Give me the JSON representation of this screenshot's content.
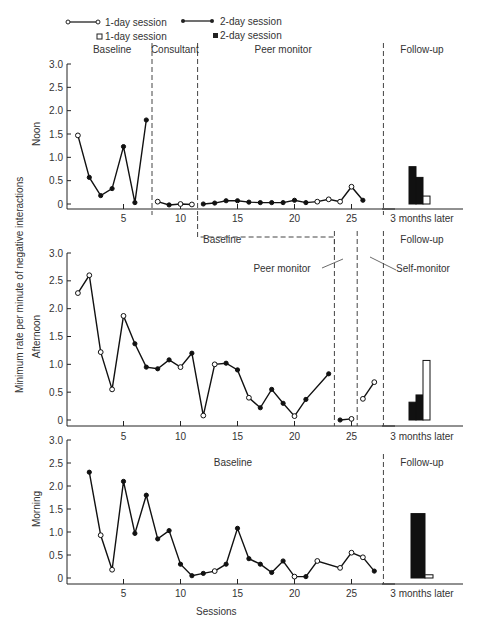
{
  "chart_data": {
    "type": "line",
    "ylabel": "Minimum rate per minute of negative interactions",
    "xlabel": "Sessions",
    "followup_xlabel": "3 months later",
    "legend": {
      "placement": "top",
      "items": [
        {
          "label": "1-day session",
          "marker": "open-circle-line"
        },
        {
          "label": "2-day session",
          "marker": "filled-circle-line"
        },
        {
          "label": "1-day session",
          "marker": "open-square"
        },
        {
          "label": "2-day session",
          "marker": "filled-square"
        }
      ]
    },
    "x_ticks": [
      5,
      10,
      15,
      20,
      25
    ],
    "xlim": [
      0,
      28
    ],
    "ylim": [
      0,
      3.0
    ],
    "y_ticks": [
      "0",
      "0.5",
      "1.0",
      "1.5",
      "2.0",
      "2.5",
      "3.0"
    ],
    "panels": [
      {
        "name": "Noon",
        "phases": [
          {
            "label": "Baseline",
            "start": 1,
            "end": 7
          },
          {
            "label": "Consultant",
            "start": 8,
            "end": 11
          },
          {
            "label": "Peer monitor",
            "start": 12,
            "end": 26
          },
          {
            "label": "Follow-up"
          }
        ],
        "phase_lines": [
          7.5,
          11.5,
          27.8
        ],
        "segments": [
          {
            "phase": "Baseline",
            "points": [
              [
                1,
                1.47,
                "o"
              ],
              [
                2,
                0.57,
                "f"
              ],
              [
                3,
                0.18,
                "f"
              ],
              [
                4,
                0.33,
                "f"
              ],
              [
                5,
                1.23,
                "f"
              ],
              [
                6,
                0.03,
                "f"
              ],
              [
                7,
                1.8,
                "f"
              ]
            ]
          },
          {
            "phase": "Consultant",
            "points": [
              [
                8,
                0.05,
                "o"
              ],
              [
                9,
                -0.02,
                "f"
              ],
              [
                10,
                0.0,
                "o"
              ],
              [
                11,
                -0.01,
                "o"
              ]
            ]
          },
          {
            "phase": "Peer monitor",
            "points": [
              [
                12,
                0.0,
                "f"
              ],
              [
                13,
                0.02,
                "f"
              ],
              [
                14,
                0.07,
                "f"
              ],
              [
                15,
                0.07,
                "f"
              ],
              [
                16,
                0.04,
                "f"
              ],
              [
                17,
                0.03,
                "f"
              ],
              [
                18,
                0.03,
                "f"
              ],
              [
                19,
                0.03,
                "f"
              ],
              [
                20,
                0.08,
                "f"
              ],
              [
                21,
                0.03,
                "f"
              ],
              [
                22,
                0.05,
                "o"
              ],
              [
                23,
                0.1,
                "o"
              ],
              [
                24,
                0.05,
                "o"
              ],
              [
                25,
                0.37,
                "o"
              ],
              [
                26,
                0.08,
                "f"
              ]
            ]
          }
        ],
        "followup_bars": [
          {
            "type": "2-day",
            "value": 0.8
          },
          {
            "type": "2-day",
            "value": 0.57
          },
          {
            "type": "1-day",
            "value": 0.17
          }
        ]
      },
      {
        "name": "Afternoon",
        "phases": [
          {
            "label": "Baseline",
            "start": 1,
            "end": 23
          },
          {
            "label": "Peer monitor",
            "start": 24,
            "end": 25
          },
          {
            "label": "Self-monitor",
            "start": 26,
            "end": 27
          },
          {
            "label": "Follow-up"
          }
        ],
        "phase_lines": [
          23.5,
          25.5,
          27.8
        ],
        "segments": [
          {
            "phase": "Baseline",
            "points": [
              [
                1,
                2.28,
                "o"
              ],
              [
                2,
                2.6,
                "o"
              ],
              [
                3,
                1.22,
                "o"
              ],
              [
                4,
                0.55,
                "o"
              ],
              [
                5,
                1.87,
                "o"
              ],
              [
                6,
                1.37,
                "f"
              ],
              [
                7,
                0.95,
                "f"
              ],
              [
                8,
                0.92,
                "f"
              ],
              [
                9,
                1.08,
                "f"
              ],
              [
                10,
                0.95,
                "o"
              ],
              [
                11,
                1.2,
                "f"
              ],
              [
                12,
                0.08,
                "o"
              ],
              [
                13,
                1.0,
                "o"
              ],
              [
                14,
                1.02,
                "f"
              ],
              [
                15,
                0.9,
                "f"
              ],
              [
                16,
                0.4,
                "o"
              ],
              [
                17,
                0.22,
                "f"
              ],
              [
                18,
                0.55,
                "f"
              ],
              [
                19,
                0.3,
                "f"
              ],
              [
                20,
                0.07,
                "o"
              ],
              [
                21,
                0.37,
                "f"
              ],
              [
                23,
                0.83,
                "f"
              ]
            ]
          },
          {
            "phase": "Peer monitor",
            "points": [
              [
                24,
                0.0,
                "f"
              ],
              [
                25,
                0.02,
                "o"
              ]
            ]
          },
          {
            "phase": "Self-monitor",
            "points": [
              [
                26,
                0.38,
                "o"
              ],
              [
                27,
                0.68,
                "o"
              ]
            ]
          }
        ],
        "followup_bars": [
          {
            "type": "2-day",
            "value": 0.32
          },
          {
            "type": "2-day",
            "value": 0.45
          },
          {
            "type": "1-day",
            "value": 1.07
          }
        ]
      },
      {
        "name": "Morning",
        "phases": [
          {
            "label": "Baseline",
            "start": 1,
            "end": 27
          },
          {
            "label": "Follow-up"
          }
        ],
        "phase_lines": [
          27.8
        ],
        "segments": [
          {
            "phase": "Baseline",
            "points": [
              [
                2,
                2.3,
                "f"
              ],
              [
                3,
                0.93,
                "o"
              ],
              [
                4,
                0.18,
                "o"
              ],
              [
                5,
                2.1,
                "f"
              ],
              [
                6,
                0.97,
                "f"
              ],
              [
                7,
                1.8,
                "f"
              ],
              [
                8,
                0.85,
                "f"
              ],
              [
                9,
                1.03,
                "f"
              ],
              [
                10,
                0.3,
                "f"
              ],
              [
                11,
                0.05,
                "f"
              ],
              [
                12,
                0.1,
                "f"
              ],
              [
                13,
                0.15,
                "o"
              ],
              [
                14,
                0.3,
                "f"
              ],
              [
                15,
                1.08,
                "f"
              ],
              [
                16,
                0.42,
                "f"
              ],
              [
                17,
                0.3,
                "f"
              ],
              [
                18,
                0.12,
                "f"
              ],
              [
                19,
                0.37,
                "f"
              ],
              [
                20,
                0.03,
                "o"
              ],
              [
                21,
                0.03,
                "f"
              ],
              [
                22,
                0.37,
                "o"
              ],
              [
                24,
                0.22,
                "o"
              ],
              [
                25,
                0.55,
                "o"
              ],
              [
                26,
                0.45,
                "o"
              ],
              [
                27,
                0.15,
                "f"
              ]
            ]
          }
        ],
        "followup_bars": [
          {
            "type": "2-day",
            "value": 1.4,
            "wide": true
          },
          {
            "type": "1-day",
            "value": 0.07
          }
        ]
      }
    ]
  }
}
